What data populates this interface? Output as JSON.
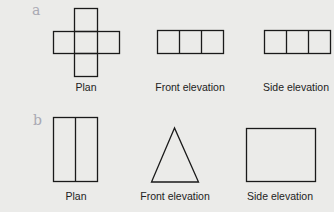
{
  "sections": [
    {
      "label": "a",
      "captions": [
        "Plan",
        "Front elevation",
        "Side elevation"
      ],
      "shapes": {
        "plan": "cross of five squares",
        "front_elevation": "row of three squares",
        "side_elevation": "row of three squares"
      }
    },
    {
      "label": "b",
      "captions": [
        "Plan",
        "Front elevation",
        "Side elevation"
      ],
      "shapes": {
        "plan": "rectangle divided vertically into two",
        "front_elevation": "triangle",
        "side_elevation": "rectangle"
      }
    }
  ],
  "colors": {
    "line": "#1a1a1a",
    "label": "#a9a9b3",
    "background": "#ebebe9"
  }
}
